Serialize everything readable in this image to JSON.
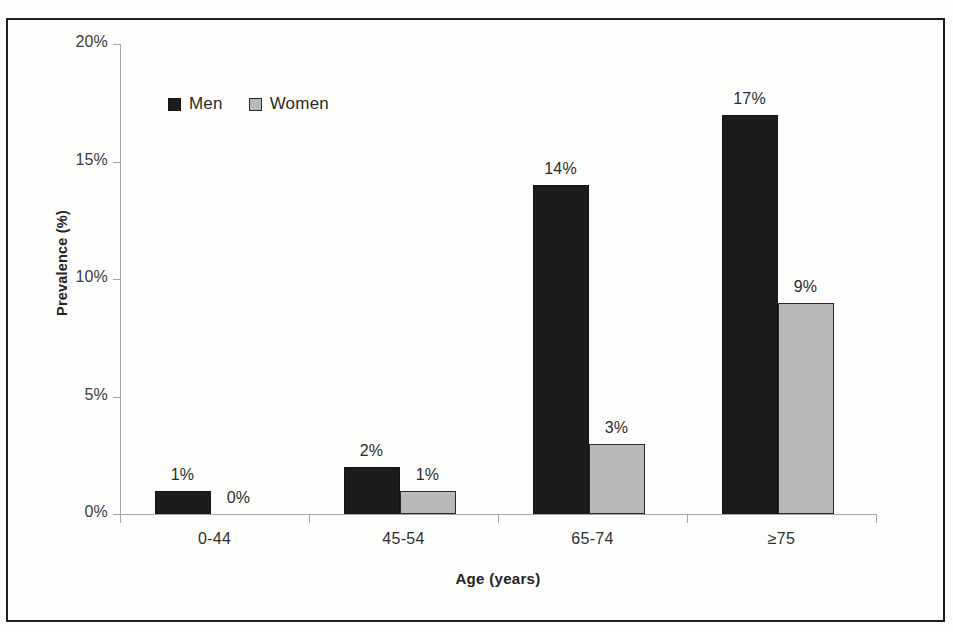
{
  "chart_data": {
    "type": "bar",
    "title": "",
    "xlabel": "Age (years)",
    "ylabel": "Prevalence (%)",
    "categories": [
      "0-44",
      "45-54",
      "65-74",
      "≥75"
    ],
    "series": [
      {
        "name": "Men",
        "color": "#1c1c1c",
        "values": [
          1,
          2,
          14,
          17
        ],
        "labels": [
          "1%",
          "2%",
          "14%",
          "17%"
        ]
      },
      {
        "name": "Women",
        "color": "#b9b9b9",
        "values": [
          0,
          1,
          3,
          9
        ],
        "labels": [
          "0%",
          "1%",
          "3%",
          "9%"
        ]
      }
    ],
    "ylim": [
      0,
      20
    ],
    "yticks": [
      0,
      5,
      10,
      15,
      20
    ],
    "ytick_labels": [
      "0%",
      "5%",
      "10%",
      "15%",
      "20%"
    ],
    "grid": false,
    "legend_position": "upper-left-inside",
    "legend": [
      "Men",
      "Women"
    ]
  }
}
